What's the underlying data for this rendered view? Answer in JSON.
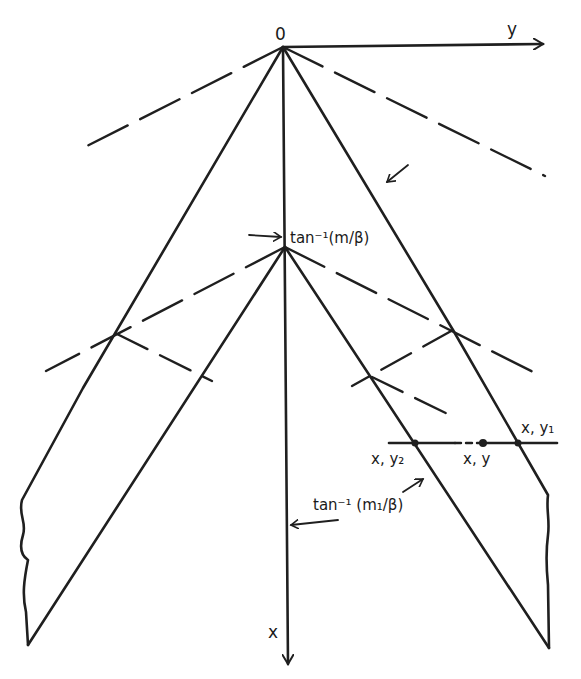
{
  "diagram": {
    "type": "mach-line characteristic diagram",
    "origin_label": "0",
    "axes": {
      "horizontal_label": "y",
      "vertical_label": "x"
    },
    "angle_labels": {
      "upper": "tan⁻¹(m/β)",
      "lower": "tan⁻¹ (m₁/β)"
    },
    "point_labels": {
      "left_intersection": "x, y₂",
      "middle_point": "x, y",
      "right_intersection": "x, y₁"
    },
    "line_color": "#1f1f1f",
    "background": "#ffffff"
  }
}
